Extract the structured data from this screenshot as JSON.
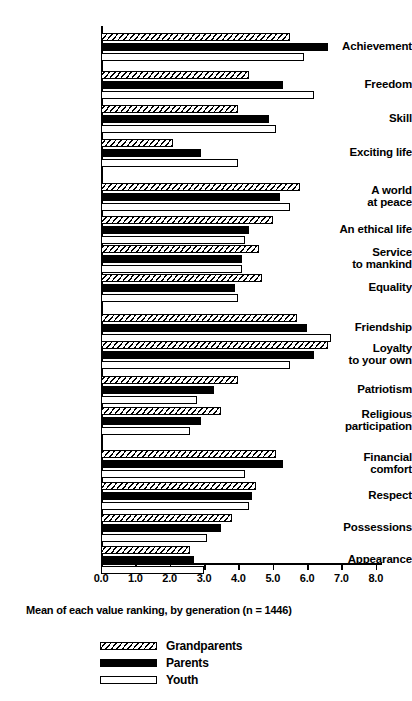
{
  "chart_data": {
    "type": "bar",
    "orientation": "horizontal",
    "title": "",
    "caption": "Mean of each value ranking, by generation (n = 1446)",
    "xlabel": "",
    "ylabel": "",
    "xlim": [
      0.0,
      8.0
    ],
    "xticks": [
      "0.0",
      "1.0",
      "2.0",
      "3.0",
      "4.0",
      "5.0",
      "6.0",
      "7.0",
      "8.0"
    ],
    "grid": false,
    "legend_position": "bottom",
    "categories": [
      "Achievement",
      "Freedom",
      "Skill",
      "Exciting life",
      "A world\nat peace",
      "An ethical life",
      "Service\nto mankind",
      "Equality",
      "Friendship",
      "Loyalty\nto your own",
      "Patriotism",
      "Religious\nparticipation",
      "Financial\ncomfort",
      "Respect",
      "Possessions",
      "Appearance"
    ],
    "series": [
      {
        "name": "Grandparents",
        "fill": "hatched",
        "values": [
          5.5,
          4.3,
          4.0,
          2.1,
          5.8,
          5.0,
          4.6,
          4.7,
          5.7,
          6.6,
          4.0,
          3.5,
          5.1,
          4.5,
          3.8,
          2.6
        ]
      },
      {
        "name": "Parents",
        "fill": "black",
        "values": [
          6.6,
          5.3,
          4.9,
          2.9,
          5.2,
          4.3,
          4.1,
          3.9,
          6.0,
          6.2,
          3.3,
          2.9,
          5.3,
          4.4,
          3.5,
          2.7
        ]
      },
      {
        "name": "Youth",
        "fill": "white",
        "values": [
          5.9,
          6.2,
          5.1,
          4.0,
          5.5,
          4.2,
          4.1,
          4.0,
          6.7,
          5.5,
          2.8,
          2.6,
          4.2,
          4.3,
          3.1,
          3.0
        ]
      }
    ]
  },
  "colors": {
    "ink": "#000000",
    "paper": "#ffffff"
  }
}
